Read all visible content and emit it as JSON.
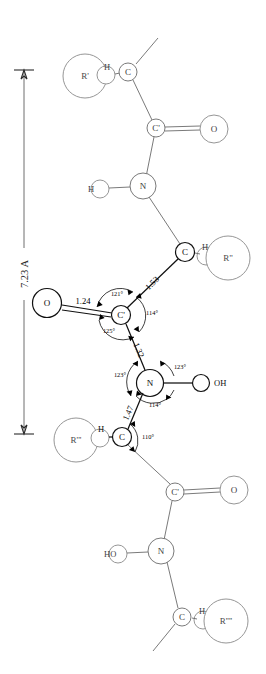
{
  "figure": {
    "type": "chemical-structure-diagram",
    "background_color": "#ffffff",
    "line_color": "#6b6b6b",
    "emphasis_color": "#111111"
  },
  "dimension": {
    "label": "7.23 A",
    "orientation": "vertical",
    "y_top": 70,
    "y_bottom": 434
  },
  "atoms": {
    "c_alpha_1": {
      "label": "C",
      "x": 128,
      "y": 72
    },
    "h_1": {
      "label": "H",
      "x": 107,
      "y": 69
    },
    "r_1": {
      "label": "R'",
      "x": 85,
      "y": 76
    },
    "c_prime_1": {
      "label": "C'",
      "x": 156,
      "y": 128
    },
    "o_1": {
      "label": "O",
      "x": 214,
      "y": 129
    },
    "n_1": {
      "label": "N",
      "x": 143,
      "y": 186
    },
    "h_n1": {
      "label": "H",
      "x": 98,
      "y": 189
    },
    "c_alpha_2": {
      "label": "C",
      "x": 185,
      "y": 252
    },
    "h_2": {
      "label": "H",
      "x": 205,
      "y": 250
    },
    "r_2": {
      "label": "R\"",
      "x": 228,
      "y": 258
    },
    "c_prime_2": {
      "label": "C'",
      "x": 121,
      "y": 315
    },
    "o_2": {
      "label": "O",
      "x": 47,
      "y": 303
    },
    "n_2": {
      "label": "N",
      "x": 150,
      "y": 383
    },
    "h_n2": {
      "label": "OH",
      "x": 211,
      "y": 383
    },
    "c_alpha_3": {
      "label": "C",
      "x": 122,
      "y": 437
    },
    "h_3": {
      "label": "H",
      "x": 101,
      "y": 432
    },
    "r_3": {
      "label": "R'''",
      "x": 76,
      "y": 440
    },
    "c_prime_3": {
      "label": "C'",
      "x": 175,
      "y": 492
    },
    "o_3": {
      "label": "O",
      "x": 234,
      "y": 490
    },
    "n_3": {
      "label": "N",
      "x": 161,
      "y": 551
    },
    "h_n3": {
      "label": "HO",
      "x": 109,
      "y": 553
    },
    "c_alpha_4": {
      "label": "C",
      "x": 182,
      "y": 617
    },
    "h_4": {
      "label": "H",
      "x": 202,
      "y": 613
    },
    "r_4": {
      "label": "R''''",
      "x": 226,
      "y": 621
    }
  },
  "bond_lengths": [
    {
      "id": "bond-c-o-124",
      "value": "1.24",
      "x": 83,
      "y": 303,
      "rotation": 0
    },
    {
      "id": "bond-ca-cp-153",
      "value": "1.53",
      "x": 152,
      "y": 283,
      "rotation": 62
    },
    {
      "id": "bond-cp-n-132",
      "value": "1.32",
      "x": 137,
      "y": 350,
      "rotation": 64
    },
    {
      "id": "bond-n-ca-147",
      "value": "1.47",
      "x": 130,
      "y": 413,
      "rotation": 62
    }
  ],
  "bond_angles": [
    {
      "id": "angle-cprime-121",
      "value": "121°",
      "x": 117,
      "y": 293
    },
    {
      "id": "angle-cprime-114",
      "value": "114°",
      "x": 151,
      "y": 312
    },
    {
      "id": "angle-cprime-125",
      "value": "125°",
      "x": 109,
      "y": 330
    },
    {
      "id": "angle-n-123-left",
      "value": "123°",
      "x": 120,
      "y": 374
    },
    {
      "id": "angle-n-123-right",
      "value": "123°",
      "x": 179,
      "y": 366
    },
    {
      "id": "angle-n-114",
      "value": "114°",
      "x": 153,
      "y": 404
    },
    {
      "id": "angle-calpha-110",
      "value": "110°",
      "x": 147,
      "y": 436
    }
  ],
  "icon_names": {
    "dimension_arrow": "dimension-arrow-icon",
    "double_bond": "double-bond-icon",
    "angle_arc": "angle-arc-icon"
  }
}
